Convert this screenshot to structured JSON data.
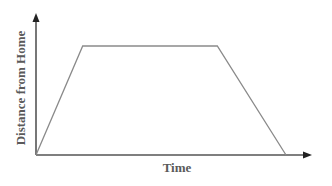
{
  "chart_data": {
    "type": "line",
    "title": "",
    "xlabel": "Time",
    "ylabel": "Distance from Home",
    "xlim": [
      0,
      10
    ],
    "ylim": [
      0,
      10
    ],
    "grid": false,
    "legend": "none",
    "series": [
      {
        "name": "journey",
        "x": [
          0,
          1.7,
          6.6,
          9.1
        ],
        "y": [
          0,
          10,
          10,
          0
        ]
      }
    ],
    "colors": {
      "line": "#8a8a8a",
      "axis": "#555555",
      "text": "#5a5a5a"
    }
  }
}
